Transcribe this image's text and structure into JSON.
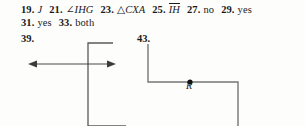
{
  "page": {
    "background_color": "#fdfdfc",
    "text_color": "#1a1a1a",
    "line_color": "#595959"
  },
  "answer_lines": [
    {
      "items": [
        {
          "number": "19.",
          "answer": "J",
          "style": "italic"
        },
        {
          "number": "21.",
          "answer": "∠IHG",
          "style": "italic-angle"
        },
        {
          "number": "23.",
          "answer": "△CXA",
          "style": "italic-triangle"
        },
        {
          "number": "25.",
          "answer": "IH",
          "style": "overbar"
        },
        {
          "number": "27.",
          "answer": "no",
          "style": "plain"
        },
        {
          "number": "29.",
          "answer": "yes",
          "style": "plain"
        }
      ]
    },
    {
      "items": [
        {
          "number": "31.",
          "answer": "yes",
          "style": "plain"
        },
        {
          "number": "33.",
          "answer": "both",
          "style": "plain"
        }
      ]
    }
  ],
  "figures": [
    {
      "number": "39.",
      "description": "horizontal double-headed arrow intersecting a vertical line",
      "point_labels": []
    },
    {
      "number": "43.",
      "description": "vertical segment descending, turning right along a horizontal segment through point R, then turning down",
      "point_labels": [
        {
          "label": "R",
          "style": "italic"
        }
      ]
    }
  ],
  "glyphs": {
    "angle": "∠",
    "triangle": "△",
    "period": "."
  }
}
